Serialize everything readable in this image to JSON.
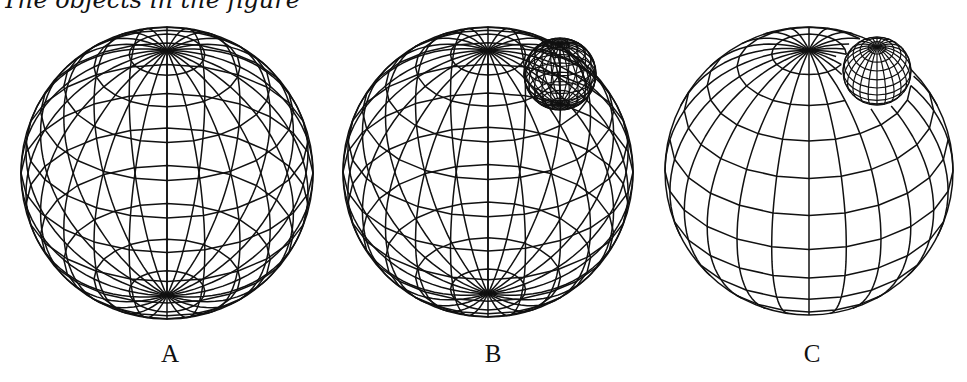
{
  "caption_partial": "The objects in the figure",
  "line_color": "#111111",
  "line_width": 1.5,
  "panels": [
    {
      "label": "A",
      "label_x": 170,
      "sphere": {
        "cx": 167,
        "cy": 173,
        "r": 146,
        "tilt_deg": 33,
        "meridians": 24,
        "parallels": 11,
        "hidden_lines": false
      },
      "inner_sphere": null
    },
    {
      "label": "B",
      "label_x": 493,
      "sphere": {
        "cx": 488,
        "cy": 172,
        "r": 145,
        "tilt_deg": 33,
        "meridians": 24,
        "parallels": 11,
        "hidden_lines": false
      },
      "inner_sphere": {
        "cx": 560,
        "cy": 74,
        "r": 36,
        "tilt_deg": 33,
        "meridians": 24,
        "parallels": 11,
        "hidden_lines": false
      }
    },
    {
      "label": "C",
      "label_x": 812,
      "sphere": {
        "cx": 809,
        "cy": 171,
        "r": 144,
        "tilt_deg": 33,
        "meridians": 24,
        "parallels": 11,
        "hidden_lines": true
      },
      "inner_sphere": {
        "cx": 877,
        "cy": 71,
        "r": 34,
        "tilt_deg": 45,
        "meridians": 24,
        "parallels": 11,
        "hidden_lines": true,
        "occlude_by_parent": false
      }
    }
  ]
}
